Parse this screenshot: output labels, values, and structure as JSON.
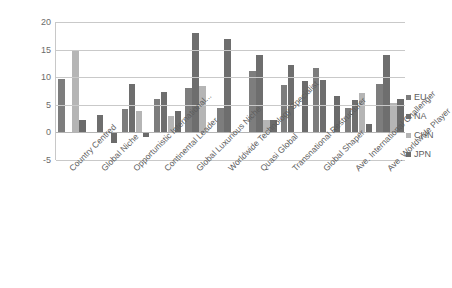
{
  "chart_data": {
    "type": "bar",
    "title": "",
    "subtitle": "",
    "xlabel": "",
    "ylabel": "",
    "ylim": [
      -5,
      20
    ],
    "yticks": [
      20,
      15,
      10,
      5,
      0,
      -5
    ],
    "grid": true,
    "legend_position": "right",
    "categories": [
      "Country Centred",
      "Global Niche",
      "Opportunistic International...",
      "Continental Leader",
      "Global Luxurious Niche",
      "Worldwide Technology Specialist",
      "Quasi Global",
      "Transnational Restructurer",
      "Global Shaper",
      "Ave. International Challenger",
      "Ave. Worldwide Player"
    ],
    "series": [
      {
        "name": "EU",
        "color": "#7d7d7d",
        "values": [
          9.6,
          0,
          4.2,
          6.1,
          8.1,
          4.4,
          11.2,
          8.6,
          11.6,
          4.4,
          8.7
        ]
      },
      {
        "name": "NA",
        "color": "#6e6e6e",
        "values": [
          0,
          3.1,
          8.7,
          7.4,
          18.0,
          17.0,
          14.0,
          12.2,
          9.5,
          5.9,
          14.1
        ]
      },
      {
        "name": "CHN",
        "color": "#b5b5b5",
        "values": [
          15.0,
          0,
          3.8,
          2.9,
          8.5,
          0,
          2.3,
          0,
          0,
          7.1,
          5.4
        ]
      },
      {
        "name": "JPN",
        "color": "#6b6b6b",
        "values": [
          2.3,
          -2.0,
          -0.8,
          3.8,
          0,
          0,
          2.2,
          9.3,
          6.6,
          1.6,
          6.0
        ]
      }
    ]
  },
  "legend": {
    "items": [
      {
        "label": "EU",
        "color": "#7d7d7d"
      },
      {
        "label": "NA",
        "color": "#6e6e6e"
      },
      {
        "label": "CHN",
        "color": "#b5b5b5"
      },
      {
        "label": "JPN",
        "color": "#6b6b6b"
      }
    ]
  }
}
